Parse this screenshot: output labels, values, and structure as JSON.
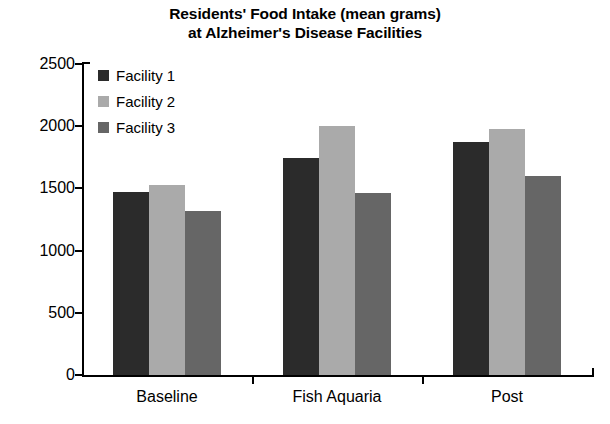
{
  "chart_data": {
    "type": "bar",
    "title": "Residents' Food Intake (mean grams) at Alzheimer's Disease Facilities",
    "title_line_1": "Residents' Food Intake (mean grams)",
    "title_line_2": "at Alzheimer's Disease Facilities",
    "xlabel": "",
    "ylabel": "",
    "categories": [
      "Baseline",
      "Fish Aquaria",
      "Post"
    ],
    "series": [
      {
        "name": "Facility 1",
        "values": [
          1475,
          1745,
          1870
        ],
        "color": "#2b2b2b"
      },
      {
        "name": "Facility 2",
        "values": [
          1530,
          2000,
          1980
        ],
        "color": "#aaaaaa"
      },
      {
        "name": "Facility 3",
        "values": [
          1320,
          1460,
          1600
        ],
        "color": "#666666"
      }
    ],
    "ylim": [
      0,
      2500
    ],
    "ytick_values": [
      2500,
      2000,
      1500,
      1000,
      500,
      0
    ],
    "ytick_labels": [
      "2500",
      "2000",
      "1500",
      "1000",
      "500",
      "0"
    ],
    "grid": false,
    "legend_position": "upper-left-inside"
  },
  "legend": {
    "items": [
      {
        "label": "Facility 1",
        "color": "#2b2b2b"
      },
      {
        "label": "Facility 2",
        "color": "#aaaaaa"
      },
      {
        "label": "Facility 3",
        "color": "#666666"
      }
    ]
  }
}
